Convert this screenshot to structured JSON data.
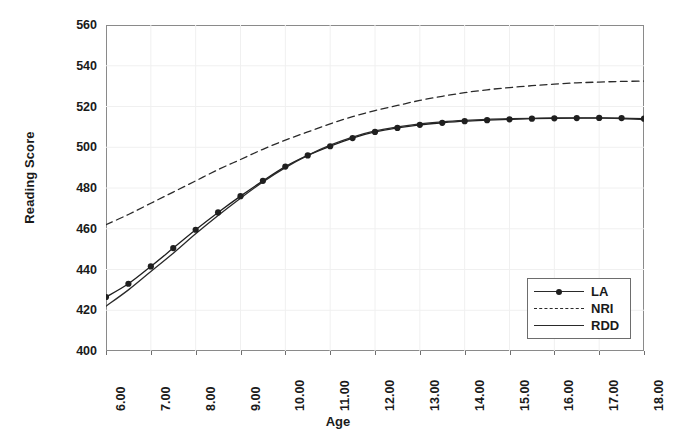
{
  "chart_data": {
    "type": "line",
    "title": "",
    "xlabel": "Age",
    "ylabel": "Reading Score",
    "xlim": [
      6.0,
      18.0
    ],
    "ylim": [
      400,
      560
    ],
    "grid": true,
    "legend_position": "bottom-right",
    "x_tick_labels": [
      "6.00",
      "7.00",
      "8.00",
      "9.00",
      "10.00",
      "11.00",
      "12.00",
      "13.00",
      "14.00",
      "15.00",
      "16.00",
      "17.00",
      "18.00"
    ],
    "x_ticks": [
      6,
      7,
      8,
      9,
      10,
      11,
      12,
      13,
      14,
      15,
      16,
      17,
      18
    ],
    "y_tick_labels": [
      "560",
      "540",
      "520",
      "500",
      "480",
      "460",
      "440",
      "420",
      "400"
    ],
    "y_ticks": [
      560,
      540,
      520,
      500,
      480,
      460,
      440,
      420,
      400
    ],
    "x": [
      6.0,
      6.5,
      7.0,
      7.5,
      8.0,
      8.5,
      9.0,
      9.5,
      10.0,
      10.5,
      11.0,
      11.5,
      12.0,
      12.5,
      13.0,
      13.5,
      14.0,
      14.5,
      15.0,
      15.5,
      16.0,
      16.5,
      17.0,
      17.5,
      18.0
    ],
    "series": [
      {
        "name": "LA",
        "style": "solid",
        "marker": "circle",
        "color": "#1f1f1f",
        "values": [
          426.5,
          433.0,
          441.5,
          450.5,
          459.5,
          468.0,
          476.0,
          483.5,
          490.5,
          496.0,
          500.5,
          504.5,
          507.5,
          509.5,
          511.0,
          512.0,
          512.8,
          513.3,
          513.7,
          514.0,
          514.2,
          514.3,
          514.4,
          514.3,
          514.0
        ]
      },
      {
        "name": "NRI",
        "style": "dashed",
        "marker": "none",
        "color": "#2a2a2a",
        "values": [
          462.0,
          467.0,
          472.5,
          478.0,
          483.5,
          489.0,
          494.0,
          499.0,
          503.5,
          507.5,
          511.5,
          515.0,
          518.0,
          520.5,
          523.0,
          525.0,
          526.8,
          528.2,
          529.3,
          530.2,
          531.0,
          531.6,
          532.0,
          532.3,
          532.5
        ]
      },
      {
        "name": "RDD",
        "style": "solid",
        "marker": "none",
        "color": "#2a2a2a",
        "values": [
          422.0,
          430.0,
          439.0,
          448.0,
          457.5,
          466.5,
          475.0,
          483.0,
          490.0,
          496.0,
          501.0,
          505.0,
          508.0,
          510.0,
          511.5,
          512.5,
          513.2,
          513.7,
          514.0,
          514.2,
          514.4,
          514.4,
          514.3,
          514.1,
          513.5
        ]
      }
    ]
  },
  "legend": {
    "entries": [
      {
        "label": "LA"
      },
      {
        "label": "NRI"
      },
      {
        "label": "RDD"
      }
    ]
  },
  "colors": {
    "axis": "#8a8a8a",
    "grid": "#f0f0f0",
    "line": "#2a2a2a",
    "marker": "#1f1f1f",
    "text": "#1a1a1a",
    "background": "#ffffff"
  }
}
